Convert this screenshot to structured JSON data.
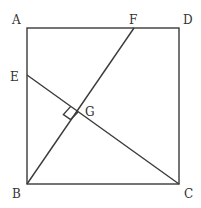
{
  "diagram": {
    "type": "geometry",
    "points": {
      "A": {
        "label": "A",
        "x": 27,
        "y": 28,
        "lx": 12,
        "ly": 24
      },
      "B": {
        "label": "B",
        "x": 27,
        "y": 184,
        "lx": 12,
        "ly": 198
      },
      "C": {
        "label": "C",
        "x": 179,
        "y": 184,
        "lx": 184,
        "ly": 198
      },
      "D": {
        "label": "D",
        "x": 179,
        "y": 28,
        "lx": 183,
        "ly": 24
      },
      "E": {
        "label": "E",
        "x": 27,
        "y": 75,
        "lx": 10,
        "ly": 81
      },
      "F": {
        "label": "F",
        "x": 134,
        "y": 28,
        "lx": 129,
        "ly": 24
      },
      "G": {
        "label": "G",
        "x": 78,
        "y": 112,
        "lx": 85,
        "ly": 115
      }
    },
    "segments": [
      "AB",
      "BC",
      "CD",
      "DA",
      "BF",
      "CE"
    ],
    "right_angle_marker": {
      "at": "G",
      "between": [
        "GE",
        "GB"
      ]
    }
  }
}
